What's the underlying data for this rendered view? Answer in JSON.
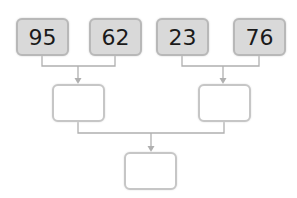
{
  "diagram": {
    "type": "addition-tree",
    "top_row": [
      {
        "value": "95"
      },
      {
        "value": "62"
      },
      {
        "value": "23"
      },
      {
        "value": "76"
      }
    ],
    "middle_row": [
      {
        "value": ""
      },
      {
        "value": ""
      }
    ],
    "bottom": {
      "value": ""
    },
    "colors": {
      "filled_box": "#d9d9d9",
      "box_border": "#b8b8b8",
      "connector": "#b0b0b0"
    }
  }
}
